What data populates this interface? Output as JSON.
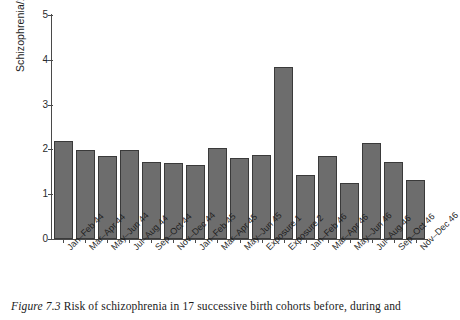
{
  "chart_data": {
    "type": "bar",
    "title": "",
    "xlabel": "",
    "ylabel": "Schizophrenia/1000",
    "ylim": [
      0,
      5
    ],
    "yticks": [
      0,
      1,
      2,
      3,
      4,
      5
    ],
    "ytick_labels": [
      "0",
      "1",
      "2",
      "3",
      "4",
      "5"
    ],
    "grid": false,
    "legend": null,
    "bar_color": "#6d6d6d",
    "bar_edge_color": "#3a3a3a",
    "categories": [
      "Jan–Feb 44",
      "Mar–Apr 44",
      "May–Jun 44",
      "Jul–Aug 44",
      "Sep–Oct 44",
      "Nov–Dec 44",
      "Jan–Feb 45",
      "Mar–Apr 45",
      "May–Jun 45",
      "Exposure 1",
      "Exposure 2",
      "Jan–Feb 46",
      "Mar–Apr 46",
      "May–Jun 46",
      "Jul–Aug 46",
      "Sep–Oct 46",
      "Nov–Dec 46"
    ],
    "values": [
      2.19,
      1.99,
      1.85,
      1.98,
      1.72,
      1.69,
      1.65,
      2.04,
      1.81,
      1.88,
      3.84,
      1.44,
      1.85,
      1.26,
      2.15,
      1.72,
      1.31
    ]
  },
  "caption": {
    "figure_number": "Figure 7.3",
    "text": " Risk of schizophrenia in 17 successive birth cohorts before, during and"
  }
}
